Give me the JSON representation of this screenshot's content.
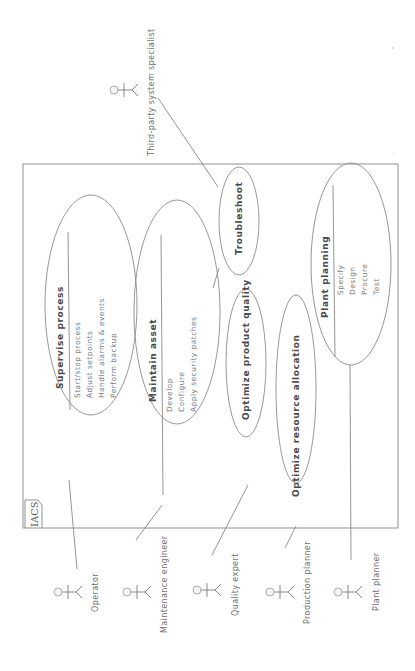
{
  "diagram": {
    "type": "uml-use-case",
    "orientation": "rotated-90-ccw",
    "system": {
      "label": "IACS"
    },
    "use_cases": [
      {
        "id": "supervise",
        "title": "Supervise process",
        "items": [
          "Start/stop process",
          "Adjust setpoints",
          "Handle alarms & events",
          "Perform backup"
        ]
      },
      {
        "id": "maintain",
        "title": "Maintain asset",
        "items": [
          "Develop",
          "Configure",
          "Apply security patches"
        ]
      },
      {
        "id": "troubleshoot",
        "title": "Troubleshoot",
        "items": []
      },
      {
        "id": "quality",
        "title": "Optimize product quality",
        "items": []
      },
      {
        "id": "resource",
        "title": "Optimize resource allocation",
        "items": []
      },
      {
        "id": "planning",
        "title": "Plant planning",
        "items": [
          "Specify",
          "Design",
          "Procure",
          "Test"
        ]
      }
    ],
    "actors": [
      {
        "id": "operator",
        "label": "Operator",
        "associates": "supervise"
      },
      {
        "id": "maintenance",
        "label": "Maintenance engineer",
        "associates": "maintain"
      },
      {
        "id": "quality",
        "label": "Quality expert",
        "associates": "quality"
      },
      {
        "id": "production",
        "label": "Production planner",
        "associates": "resource"
      },
      {
        "id": "plant",
        "label": "Plant planner",
        "associates": "planning"
      },
      {
        "id": "thirdparty",
        "label": "Third-party system specialist",
        "associates": "troubleshoot"
      }
    ],
    "colors": {
      "line": "#8a8a8a",
      "text_title": "#4a4a4a",
      "text_item": "#7a7a7a",
      "background": "#ffffff"
    }
  }
}
